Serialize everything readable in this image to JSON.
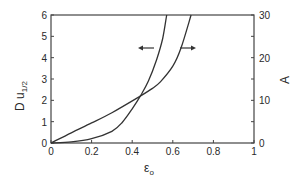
{
  "chart_data": {
    "type": "line",
    "title": "",
    "xlabel": "ε_o",
    "ylabel": "Du_1/2",
    "ylabel_right": "A",
    "xlim": [
      0,
      1
    ],
    "ylim": [
      0,
      6
    ],
    "ylim_right": [
      0,
      30
    ],
    "grid": false,
    "legend": "none (arrows indicate axis for each curve)",
    "x_ticks": [
      "0",
      "0.2",
      "0.4",
      "0.6",
      "0.8",
      "1"
    ],
    "y_ticks": [
      "0",
      "1",
      "2",
      "3",
      "4",
      "5",
      "6"
    ],
    "y_ticks_right": [
      "0",
      "10",
      "20",
      "30"
    ],
    "series": [
      {
        "name": "Du_1/2",
        "axis": "left",
        "annotation": "arrow pointing left",
        "x": [
          0,
          0.1,
          0.2,
          0.3,
          0.35,
          0.4,
          0.44,
          0.48,
          0.52,
          0.55,
          0.57
        ],
        "y": [
          0,
          0.05,
          0.2,
          0.55,
          0.95,
          1.6,
          2.2,
          2.9,
          3.9,
          4.9,
          6
        ]
      },
      {
        "name": "A",
        "axis": "right",
        "annotation": "arrow pointing right",
        "x": [
          0,
          0.1,
          0.2,
          0.3,
          0.44,
          0.5,
          0.54,
          0.6,
          0.64,
          0.69
        ],
        "y": [
          0,
          2.4,
          4.7,
          7.1,
          11,
          12.8,
          14.4,
          18,
          22.2,
          30
        ]
      }
    ]
  },
  "labels": {
    "ylabel_main": "D u",
    "ylabel_sub": "1/2",
    "ylabel_right": "A",
    "xlabel_main": "ε",
    "xlabel_sub": "o"
  },
  "colors": {
    "line": "#333333",
    "axis": "#444444",
    "text": "#2a2a2a"
  }
}
